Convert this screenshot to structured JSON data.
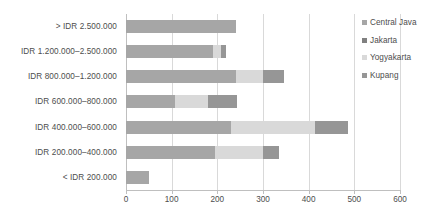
{
  "chart_data": {
    "type": "bar",
    "orientation": "horizontal",
    "stacked": true,
    "title": "",
    "subtitle": "",
    "xlabel": "",
    "ylabel": "",
    "xlim": [
      0,
      600
    ],
    "xticks": [
      0,
      100,
      200,
      300,
      400,
      500,
      600
    ],
    "xtick_labels": [
      "0",
      "100",
      "200",
      "300",
      "400",
      "500",
      "600"
    ],
    "grid": true,
    "grid_axis": "x",
    "legend_position": "right",
    "categories": [
      "> IDR 2.500.000",
      "IDR 1.200.000–2.500.000",
      "IDR 800.000–1.200.000",
      "IDR 600.000–800.000",
      "IDR 400.000–600.000",
      "IDR 200.000–400.000",
      "< IDR 200.000"
    ],
    "series": [
      {
        "name": "Central Java",
        "color": "#a6a6a6",
        "values": [
          240,
          190,
          240,
          108,
          230,
          195,
          50
        ]
      },
      {
        "name": "Jakarta",
        "color": "#808080",
        "values": [
          0,
          0,
          0,
          0,
          0,
          0,
          0
        ]
      },
      {
        "name": "Yogyakarta",
        "color": "#d9d9d9",
        "values": [
          0,
          17,
          60,
          72,
          183,
          105,
          0
        ]
      },
      {
        "name": "Kupang",
        "color": "#969696",
        "values": [
          0,
          13,
          47,
          63,
          74,
          35,
          0
        ]
      }
    ],
    "totals": [
      240,
      220,
      347,
      243,
      487,
      335,
      50
    ]
  },
  "legend": {
    "items": [
      {
        "label": "Central Java",
        "color": "#a6a6a6"
      },
      {
        "label": "Jakarta",
        "color": "#808080"
      },
      {
        "label": "Yogyakarta",
        "color": "#d9d9d9"
      },
      {
        "label": "Kupang",
        "color": "#969696"
      }
    ]
  },
  "colors": {
    "background": "#ffffff",
    "gridline": "#d9d9d9",
    "axis": "#bfbfbf",
    "text": "#4d4d4d"
  }
}
